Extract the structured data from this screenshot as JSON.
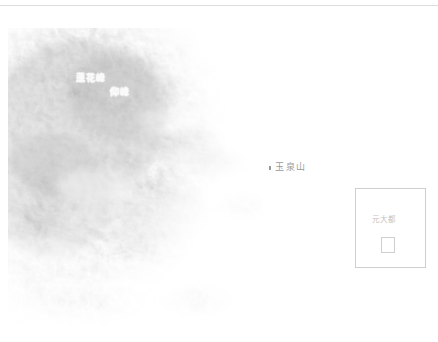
{
  "map": {
    "background_color": "#ffffff",
    "terrain_color_dark": "#9d9d9d",
    "terrain_color_mid": "#c3c3c3",
    "terrain_color_light": "#e8e8e8",
    "labels": [
      {
        "id": "lianhuafeng",
        "text": "蓮花峰",
        "x": 76,
        "y": 74,
        "style": "peak"
      },
      {
        "id": "yangfeng",
        "text": "仰峰",
        "x": 110,
        "y": 88,
        "style": "peak"
      },
      {
        "id": "yuquanshan",
        "text": "玉泉山",
        "x": 275,
        "y": 163,
        "style": "plain"
      }
    ],
    "markers": [
      {
        "id": "yuquanshan-marker",
        "x": 269,
        "y": 166
      }
    ]
  },
  "inset": {
    "title": "元大都",
    "border_color": "#cfcfcf"
  }
}
